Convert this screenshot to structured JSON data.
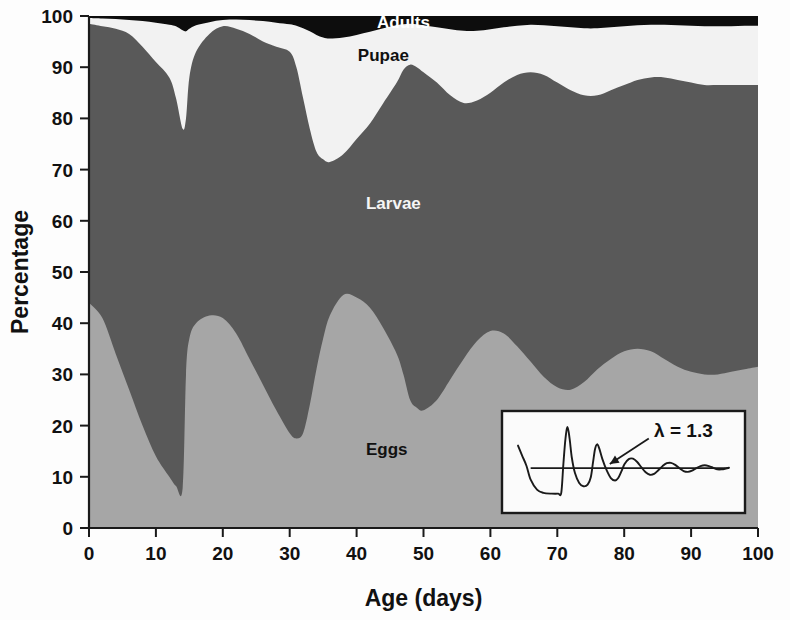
{
  "chart_data": {
    "type": "area",
    "title": "",
    "subtitle": "",
    "xlabel": "Age (days)",
    "ylabel": "Percentage",
    "xlim": [
      0,
      100
    ],
    "ylim": [
      0,
      100
    ],
    "xticks": [
      0,
      10,
      20,
      30,
      40,
      50,
      60,
      70,
      80,
      90,
      100
    ],
    "yticks": [
      0,
      10,
      20,
      30,
      40,
      50,
      60,
      70,
      80,
      90,
      100
    ],
    "grid": false,
    "legend_position": "inline-annotations",
    "stacked": true,
    "stack_order_bottom_to_top": [
      "Eggs",
      "Larvae",
      "Pupae",
      "Adults"
    ],
    "x": [
      0,
      2,
      4,
      6,
      8,
      10,
      12,
      13,
      14,
      14.5,
      15,
      16,
      18,
      20,
      22,
      24,
      26,
      28,
      30,
      31,
      32,
      33,
      34,
      35,
      36,
      38,
      40,
      42,
      44,
      46,
      47,
      48,
      49,
      50,
      52,
      54,
      56,
      58,
      60,
      62,
      64,
      66,
      68,
      70,
      72,
      74,
      76,
      78,
      80,
      82,
      84,
      86,
      88,
      90,
      92,
      94,
      96,
      98,
      100
    ],
    "series": [
      {
        "name": "Eggs",
        "color": "#a6a6a6",
        "label_color": "#111111",
        "cumulative_top": [
          44,
          41,
          34,
          27,
          20,
          14,
          10,
          8.2,
          7.8,
          30,
          37,
          40,
          41.5,
          41,
          38,
          33,
          28,
          23,
          18.5,
          17.5,
          18.5,
          24,
          31,
          37,
          41.5,
          45.5,
          45,
          43,
          39,
          34,
          30,
          25,
          23.5,
          23,
          25,
          29,
          33,
          36.5,
          38.5,
          38,
          35.5,
          32.5,
          29.5,
          27.5,
          27,
          28.5,
          31,
          33,
          34.5,
          35,
          34.5,
          33,
          31.5,
          30.5,
          30,
          30,
          30.5,
          31,
          31.5
        ]
      },
      {
        "name": "Larvae",
        "color": "#595959",
        "label_color": "#f5f5f5",
        "cumulative_top": [
          98.5,
          98,
          97.5,
          96.5,
          94,
          91,
          88,
          84,
          78,
          80,
          88,
          93,
          96.5,
          98,
          97.5,
          96.5,
          95,
          94,
          93,
          90,
          84,
          78,
          73.5,
          72,
          71.5,
          73,
          76,
          79,
          83,
          87,
          89.5,
          90.5,
          90,
          89,
          87,
          84.5,
          83,
          83.5,
          85,
          87,
          88.5,
          89,
          88.5,
          87,
          85.5,
          84.5,
          84.5,
          85.5,
          86.5,
          87.5,
          88,
          88,
          87.5,
          87,
          86.5,
          86.5,
          86.5,
          86.5,
          86.5
        ]
      },
      {
        "name": "Pupae",
        "color": "#f2f2f2",
        "label_color": "#111111",
        "cumulative_top": [
          99.6,
          99.5,
          99.4,
          99.2,
          99.0,
          98.7,
          98.3,
          98.0,
          97.2,
          97.0,
          97.5,
          98.2,
          98.8,
          99.2,
          99.3,
          99.2,
          99.0,
          98.7,
          98.4,
          98.1,
          97.6,
          97.0,
          96.3,
          95.8,
          95.6,
          95.8,
          96.3,
          96.9,
          97.6,
          98.2,
          98.4,
          98.5,
          98.4,
          98.2,
          97.8,
          97.4,
          97.1,
          97.1,
          97.4,
          97.8,
          98.1,
          98.3,
          98.2,
          98.0,
          97.8,
          97.6,
          97.6,
          97.8,
          98.0,
          98.2,
          98.3,
          98.3,
          98.2,
          98.1,
          98.0,
          98.0,
          98.0,
          98.1,
          98.1
        ]
      },
      {
        "name": "Adults",
        "color": "#0d0d0d",
        "label_color": "#ffffff",
        "cumulative_top": [
          100,
          100,
          100,
          100,
          100,
          100,
          100,
          100,
          100,
          100,
          100,
          100,
          100,
          100,
          100,
          100,
          100,
          100,
          100,
          100,
          100,
          100,
          100,
          100,
          100,
          100,
          100,
          100,
          100,
          100,
          100,
          100,
          100,
          100,
          100,
          100,
          100,
          100,
          100,
          100,
          100,
          100,
          100,
          100,
          100,
          100,
          100,
          100,
          100,
          100,
          100,
          100,
          100,
          100,
          100,
          100,
          100,
          100,
          100
        ]
      }
    ],
    "annotations": [
      {
        "name": "adults-label",
        "text": "Adults",
        "x": 47,
        "y": 98.9
      },
      {
        "name": "pupae-label",
        "text": "Pupae",
        "x": 44,
        "y": 92.3
      },
      {
        "name": "larvae-label",
        "text": "Larvae",
        "x": 45.5,
        "y": 63.5
      },
      {
        "name": "eggs-label",
        "text": "Eggs",
        "x": 44.5,
        "y": 15.5
      }
    ],
    "inset": {
      "name": "damped-oscillation-inset",
      "label": "λ = 1.3",
      "lambda_value": 1.3,
      "description": "damped oscillation approaching steady state",
      "baseline_y": 0,
      "curve_points": [
        [
          0.0,
          0.55
        ],
        [
          0.02,
          0.3
        ],
        [
          0.04,
          0.06
        ],
        [
          0.06,
          -0.28
        ],
        [
          0.09,
          -0.52
        ],
        [
          0.12,
          -0.6
        ],
        [
          0.16,
          -0.62
        ],
        [
          0.19,
          -0.62
        ],
        [
          0.205,
          -0.6
        ],
        [
          0.215,
          0.1
        ],
        [
          0.225,
          0.72
        ],
        [
          0.235,
          1.0
        ],
        [
          0.245,
          0.7
        ],
        [
          0.255,
          0.26
        ],
        [
          0.27,
          -0.12
        ],
        [
          0.29,
          -0.36
        ],
        [
          0.31,
          -0.44
        ],
        [
          0.33,
          -0.4
        ],
        [
          0.345,
          -0.22
        ],
        [
          0.355,
          0.12
        ],
        [
          0.365,
          0.46
        ],
        [
          0.375,
          0.58
        ],
        [
          0.385,
          0.48
        ],
        [
          0.4,
          0.22
        ],
        [
          0.42,
          -0.05
        ],
        [
          0.44,
          -0.24
        ],
        [
          0.46,
          -0.3
        ],
        [
          0.475,
          -0.24
        ],
        [
          0.49,
          -0.08
        ],
        [
          0.505,
          0.1
        ],
        [
          0.525,
          0.22
        ],
        [
          0.545,
          0.23
        ],
        [
          0.565,
          0.15
        ],
        [
          0.585,
          0.02
        ],
        [
          0.605,
          -0.1
        ],
        [
          0.625,
          -0.16
        ],
        [
          0.645,
          -0.14
        ],
        [
          0.665,
          -0.05
        ],
        [
          0.685,
          0.05
        ],
        [
          0.705,
          0.12
        ],
        [
          0.725,
          0.13
        ],
        [
          0.745,
          0.08
        ],
        [
          0.765,
          0.0
        ],
        [
          0.785,
          -0.07
        ],
        [
          0.805,
          -0.09
        ],
        [
          0.825,
          -0.06
        ],
        [
          0.845,
          0.0
        ],
        [
          0.865,
          0.05
        ],
        [
          0.885,
          0.07
        ],
        [
          0.905,
          0.05
        ],
        [
          0.925,
          0.01
        ],
        [
          0.945,
          -0.03
        ],
        [
          0.965,
          -0.03
        ],
        [
          0.985,
          -0.01
        ],
        [
          1.0,
          0.01
        ]
      ],
      "arrow_from": [
        0.62,
        0.72
      ],
      "arrow_to": [
        0.435,
        0.1
      ]
    }
  },
  "axes": {
    "x_title": "Age (days)",
    "y_title": "Percentage"
  }
}
